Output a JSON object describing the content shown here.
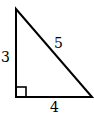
{
  "diagram": {
    "type": "right-triangle",
    "sides": {
      "vertical_leg": "3",
      "hypotenuse": "5",
      "horizontal_leg": "4"
    },
    "right_angle_marker": true,
    "stroke_color": "#000000",
    "background": "#ffffff"
  }
}
